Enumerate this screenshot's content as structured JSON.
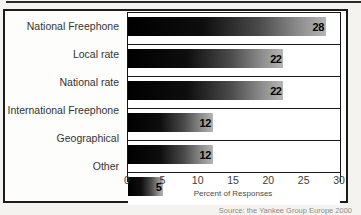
{
  "chart_data": {
    "type": "bar",
    "orientation": "horizontal",
    "categories": [
      "National Freephone",
      "Local rate",
      "National rate",
      "International Freephone",
      "Geographical",
      "Other"
    ],
    "values": [
      28,
      22,
      22,
      12,
      12,
      5
    ],
    "xlabel": "Percent of Responses",
    "xlim": [
      0,
      30
    ],
    "xticks": [
      0,
      5,
      10,
      15,
      20,
      25,
      30
    ],
    "legend": "none",
    "grid": "each bar sits in a white bordered row cell",
    "bar_style": "black-to-gray left-to-right gradient",
    "value_label_position": "bold number at right end of bar"
  },
  "source_note": "Source: the Yankee Group Europe 2000",
  "colors": {
    "bar_gradient_start": "#000000",
    "bar_gradient_end": "#b5b5b5",
    "frame": "#1b1b1b",
    "page_background": "#f4f3ef",
    "panel_background": "#fdfdfc",
    "category_text": "#333331",
    "value_text": "#000000",
    "source_text": "#8d8b85"
  }
}
